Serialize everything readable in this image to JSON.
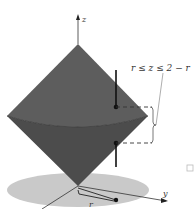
{
  "figure": {
    "type": "3d-solid-region",
    "axes": {
      "z_label": "z",
      "y_label": "y",
      "r_label": "r"
    },
    "annotation": {
      "inequality": "r ≤ z ≤ 2 − r"
    },
    "colors": {
      "upper_cone": "#5b5b5b",
      "lower_cone": "#4a4a4a",
      "disk": "#c9c9c9",
      "background": "#ffffff",
      "line": "#222222"
    }
  }
}
